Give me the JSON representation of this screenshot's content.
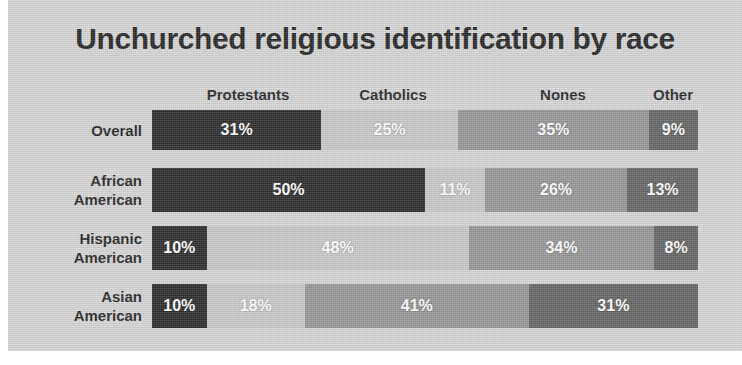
{
  "chart": {
    "title": "Unchurched religious identification by race",
    "background_color": "#d2d2d2",
    "page_background_color": "#ffffff"
  },
  "chart_data": {
    "type": "bar",
    "orientation": "horizontal",
    "stacked": true,
    "normalized_percent": true,
    "title": "Unchurched religious identification by race",
    "xlabel": "",
    "ylabel": "",
    "xlim": [
      0,
      100
    ],
    "grid": false,
    "legend_position": "top",
    "value_suffix": "%",
    "categories": [
      "Overall",
      "African American",
      "Hispanic American",
      "Asian American"
    ],
    "category_lines": [
      [
        "Overall"
      ],
      [
        "African",
        "American"
      ],
      [
        "Hispanic",
        "American"
      ],
      [
        "Asian",
        "American"
      ]
    ],
    "series": [
      {
        "name": "Protestants",
        "color": "#1c1c1c",
        "values": [
          31,
          50,
          10,
          10
        ],
        "labels": [
          "31%",
          "50%",
          "10%",
          "10%"
        ]
      },
      {
        "name": "Catholics",
        "color": "#c4c4c4",
        "values": [
          25,
          11,
          48,
          18
        ],
        "labels": [
          "25%",
          "11%",
          "48%",
          "18%"
        ]
      },
      {
        "name": "Nones",
        "color": "#8f8f8f",
        "values": [
          35,
          26,
          34,
          41
        ],
        "labels": [
          "35%",
          "26%",
          "34%",
          "41%"
        ]
      },
      {
        "name": "Other",
        "color": "#5a5a5a",
        "values": [
          9,
          13,
          8,
          31
        ],
        "labels": [
          "9%",
          "13%",
          "8%",
          "31%"
        ]
      }
    ],
    "legend_label_centers_px": [
      96,
      241,
      411,
      521
    ]
  }
}
